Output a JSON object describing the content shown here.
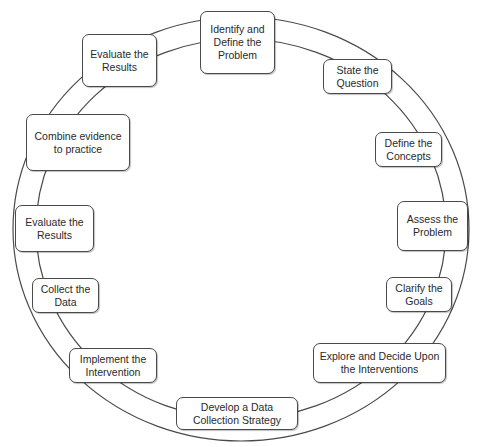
{
  "diagram": {
    "type": "cycle",
    "ring_color": "#4a4a4a",
    "nodes": [
      {
        "label": "Identify and\nDefine the\nProblem"
      },
      {
        "label": "State the\nQuestion"
      },
      {
        "label": "Define the\nConcepts"
      },
      {
        "label": "Assess the\nProblem"
      },
      {
        "label": "Clarify the\nGoals"
      },
      {
        "label": "Explore and Decide Upon\nthe Interventions"
      },
      {
        "label": "Develop a Data\nCollection Strategy"
      },
      {
        "label": "Implement the\nIntervention"
      },
      {
        "label": "Collect the\nData"
      },
      {
        "label": "Evaluate the\nResults"
      },
      {
        "label": "Combine evidence\nto practice"
      },
      {
        "label": "Evaluate the\nResults"
      }
    ]
  }
}
